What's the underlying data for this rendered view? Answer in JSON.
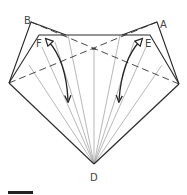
{
  "diagram": {
    "labels": {
      "A": "A",
      "B": "B",
      "D": "D",
      "E": "E",
      "F": "F"
    },
    "colors": {
      "outline": "#2a2a2a",
      "fold_lines": "#9a9a9a",
      "dashed_valley": "#333333",
      "arrows": "#222222",
      "scale_bar": "#222222"
    },
    "points": {
      "B": [
        31,
        22
      ],
      "A": [
        157,
        22
      ],
      "F_corner": [
        39,
        35
      ],
      "E_corner": [
        150,
        35
      ],
      "left": [
        9,
        83
      ],
      "right": [
        179,
        84
      ],
      "D": [
        94,
        164
      ],
      "center": [
        94,
        49
      ]
    },
    "arrows": [
      {
        "name": "left-fold-arrow",
        "from": "F",
        "direction": "down"
      },
      {
        "name": "right-fold-arrow",
        "from": "E",
        "direction": "down"
      }
    ],
    "scale_bar": {
      "visible": true
    }
  }
}
